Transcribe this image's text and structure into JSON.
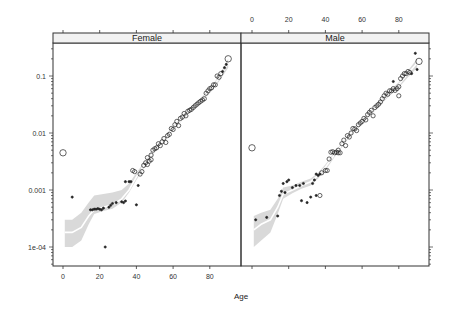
{
  "chart_data": {
    "type": "scatter",
    "title": "",
    "xlabel": "Age",
    "ylabel": "",
    "yscale": "log",
    "ylim": [
      5e-05,
      0.4
    ],
    "xlim": [
      -6,
      99
    ],
    "x_ticks": [
      0,
      20,
      40,
      60,
      80
    ],
    "y_ticks": [
      {
        "value": 0.1,
        "label": "0.1"
      },
      {
        "value": 0.01,
        "label": "0.01"
      },
      {
        "value": 0.001,
        "label": "0.001"
      },
      {
        "value": 0.0001,
        "label": "1e-04"
      }
    ],
    "grid": false,
    "smoother": "loess with grey confidence band",
    "panels": [
      {
        "strip": "Female",
        "points": [
          [
            0,
            0.0045,
            3
          ],
          [
            5,
            0.00075,
            1
          ],
          [
            15,
            0.00045,
            1
          ],
          [
            16,
            0.00045,
            1
          ],
          [
            17,
            0.00046,
            1
          ],
          [
            18,
            0.00046,
            1
          ],
          [
            19,
            0.00047,
            1
          ],
          [
            20,
            0.00046,
            1
          ],
          [
            21,
            0.00045,
            1
          ],
          [
            23,
            0.0001,
            1
          ],
          [
            22,
            0.00048,
            1
          ],
          [
            25,
            0.0005,
            1
          ],
          [
            26,
            0.00054,
            1
          ],
          [
            27,
            0.00058,
            1
          ],
          [
            29,
            0.0006,
            1
          ],
          [
            32,
            0.00062,
            1
          ],
          [
            33,
            0.0006,
            1
          ],
          [
            34,
            0.00064,
            1
          ],
          [
            34,
            0.0014,
            1
          ],
          [
            36,
            0.0014,
            1
          ],
          [
            37,
            0.0014,
            1
          ],
          [
            40,
            0.00055,
            1
          ],
          [
            41,
            0.0012,
            1
          ],
          [
            38,
            0.0022,
            2
          ],
          [
            39,
            0.0021,
            2
          ],
          [
            42,
            0.0019,
            2
          ],
          [
            43,
            0.0021,
            2
          ],
          [
            44,
            0.0027,
            2
          ],
          [
            46,
            0.0028,
            2
          ],
          [
            47,
            0.0032,
            2
          ],
          [
            45,
            0.003,
            2
          ],
          [
            46,
            0.0037,
            2
          ],
          [
            48,
            0.0034,
            2
          ],
          [
            48,
            0.0041,
            2
          ],
          [
            49,
            0.005,
            2
          ],
          [
            50,
            0.0053,
            2
          ],
          [
            51,
            0.0055,
            2
          ],
          [
            52,
            0.0065,
            2
          ],
          [
            53,
            0.006,
            2
          ],
          [
            54,
            0.007,
            2
          ],
          [
            55,
            0.008,
            2
          ],
          [
            56,
            0.0068,
            2
          ],
          [
            57,
            0.009,
            2
          ],
          [
            58,
            0.0095,
            2
          ],
          [
            59,
            0.012,
            2
          ],
          [
            60,
            0.0115,
            2
          ],
          [
            61,
            0.014,
            2
          ],
          [
            62,
            0.016,
            2
          ],
          [
            63,
            0.0135,
            2
          ],
          [
            64,
            0.018,
            2
          ],
          [
            65,
            0.019,
            2
          ],
          [
            66,
            0.022,
            2
          ],
          [
            67,
            0.02,
            2
          ],
          [
            68,
            0.024,
            2
          ],
          [
            69,
            0.025,
            2
          ],
          [
            70,
            0.026,
            2
          ],
          [
            71,
            0.028,
            2
          ],
          [
            72,
            0.03,
            2
          ],
          [
            73,
            0.032,
            2
          ],
          [
            74,
            0.034,
            2
          ],
          [
            75,
            0.036,
            2
          ],
          [
            76,
            0.038,
            2
          ],
          [
            77,
            0.04,
            2
          ],
          [
            78,
            0.05,
            2
          ],
          [
            79,
            0.055,
            2
          ],
          [
            80,
            0.06,
            2
          ],
          [
            81,
            0.062,
            2
          ],
          [
            82,
            0.07,
            2
          ],
          [
            83,
            0.07,
            2
          ],
          [
            84,
            0.1,
            2
          ],
          [
            85,
            0.095,
            2
          ],
          [
            86,
            0.11,
            2
          ],
          [
            87,
            0.12,
            1
          ],
          [
            88,
            0.14,
            1
          ],
          [
            89,
            0.16,
            1
          ],
          [
            90,
            0.2,
            3
          ]
        ],
        "smooth": [
          [
            1,
            0.00018
          ],
          [
            5,
            0.00018
          ],
          [
            10,
            0.00022
          ],
          [
            14,
            0.00035
          ],
          [
            17,
            0.00045
          ],
          [
            22,
            0.0005
          ],
          [
            27,
            0.00055
          ],
          [
            32,
            0.0007
          ],
          [
            36,
            0.001
          ],
          [
            40,
            0.0017
          ],
          [
            45,
            0.003
          ],
          [
            50,
            0.005
          ],
          [
            55,
            0.008
          ],
          [
            60,
            0.012
          ],
          [
            65,
            0.018
          ],
          [
            70,
            0.027
          ],
          [
            75,
            0.038
          ],
          [
            80,
            0.055
          ],
          [
            85,
            0.09
          ],
          [
            90,
            0.17
          ]
        ],
        "band": [
          [
            1,
            0.0001,
            0.0003
          ],
          [
            5,
            0.0001,
            0.0003
          ],
          [
            10,
            0.00013,
            0.0004
          ],
          [
            14,
            0.00025,
            0.0006
          ],
          [
            17,
            0.00038,
            0.0008
          ],
          [
            22,
            0.00043,
            0.00085
          ],
          [
            27,
            0.00047,
            0.0009
          ],
          [
            32,
            0.0006,
            0.001
          ],
          [
            36,
            0.0009,
            0.0013
          ],
          [
            40,
            0.0015,
            0.002
          ],
          [
            45,
            0.0027,
            0.0033
          ],
          [
            50,
            0.0046,
            0.0055
          ],
          [
            55,
            0.0074,
            0.0087
          ],
          [
            60,
            0.011,
            0.013
          ],
          [
            65,
            0.0168,
            0.0195
          ],
          [
            70,
            0.025,
            0.029
          ],
          [
            75,
            0.035,
            0.041
          ],
          [
            80,
            0.05,
            0.06
          ],
          [
            85,
            0.08,
            0.1
          ],
          [
            90,
            0.14,
            0.2
          ]
        ]
      },
      {
        "strip": "Male",
        "points": [
          [
            0,
            0.0055,
            3
          ],
          [
            2,
            0.0003,
            1
          ],
          [
            8,
            0.00033,
            1
          ],
          [
            14,
            0.00035,
            1
          ],
          [
            15,
            0.0008,
            1
          ],
          [
            16,
            0.00095,
            1
          ],
          [
            17,
            0.0013,
            1
          ],
          [
            19,
            0.0014,
            1
          ],
          [
            20,
            0.0015,
            1
          ],
          [
            18,
            0.0009,
            1
          ],
          [
            22,
            0.0011,
            1
          ],
          [
            24,
            0.0012,
            1
          ],
          [
            26,
            0.0012,
            1
          ],
          [
            27,
            0.00065,
            1
          ],
          [
            28,
            0.0013,
            1
          ],
          [
            30,
            0.0006,
            1
          ],
          [
            32,
            0.00075,
            1
          ],
          [
            33,
            0.0013,
            1
          ],
          [
            34,
            0.0015,
            1
          ],
          [
            35,
            0.0019,
            1
          ],
          [
            36,
            0.0018,
            1
          ],
          [
            37,
            0.0019,
            1
          ],
          [
            35,
            0.0008,
            1
          ],
          [
            37,
            0.0008,
            2
          ],
          [
            38,
            0.002,
            2
          ],
          [
            40,
            0.0022,
            2
          ],
          [
            41,
            0.0022,
            2
          ],
          [
            42,
            0.0035,
            2
          ],
          [
            43,
            0.0046,
            2
          ],
          [
            44,
            0.0047,
            2
          ],
          [
            45,
            0.0045,
            2
          ],
          [
            46,
            0.0046,
            2
          ],
          [
            47,
            0.0045,
            2
          ],
          [
            47,
            0.005,
            2
          ],
          [
            48,
            0.0045,
            2
          ],
          [
            49,
            0.0065,
            2
          ],
          [
            50,
            0.0075,
            2
          ],
          [
            51,
            0.006,
            2
          ],
          [
            52,
            0.009,
            2
          ],
          [
            53,
            0.0085,
            2
          ],
          [
            54,
            0.01,
            2
          ],
          [
            55,
            0.012,
            2
          ],
          [
            56,
            0.0118,
            2
          ],
          [
            57,
            0.011,
            2
          ],
          [
            58,
            0.014,
            2
          ],
          [
            59,
            0.015,
            2
          ],
          [
            60,
            0.016,
            2
          ],
          [
            61,
            0.018,
            2
          ],
          [
            62,
            0.017,
            2
          ],
          [
            63,
            0.021,
            2
          ],
          [
            64,
            0.023,
            2
          ],
          [
            65,
            0.025,
            2
          ],
          [
            66,
            0.02,
            2
          ],
          [
            67,
            0.028,
            2
          ],
          [
            68,
            0.03,
            2
          ],
          [
            69,
            0.032,
            2
          ],
          [
            70,
            0.035,
            2
          ],
          [
            71,
            0.04,
            2
          ],
          [
            72,
            0.045,
            2
          ],
          [
            73,
            0.05,
            2
          ],
          [
            74,
            0.048,
            2
          ],
          [
            75,
            0.055,
            2
          ],
          [
            76,
            0.055,
            2
          ],
          [
            77,
            0.06,
            2
          ],
          [
            78,
            0.056,
            2
          ],
          [
            79,
            0.06,
            2
          ],
          [
            80,
            0.065,
            2
          ],
          [
            80,
            0.045,
            2
          ],
          [
            77,
            0.08,
            1
          ],
          [
            81,
            0.09,
            2
          ],
          [
            82,
            0.1,
            2
          ],
          [
            83,
            0.11,
            2
          ],
          [
            84,
            0.11,
            2
          ],
          [
            85,
            0.12,
            2
          ],
          [
            86,
            0.115,
            2
          ],
          [
            87,
            0.11,
            1
          ],
          [
            89,
            0.25,
            1
          ],
          [
            90,
            0.13,
            1
          ],
          [
            91,
            0.18,
            3
          ]
        ],
        "smooth": [
          [
            1,
            0.0002
          ],
          [
            5,
            0.00025
          ],
          [
            10,
            0.0003
          ],
          [
            14,
            0.0005
          ],
          [
            17,
            0.00085
          ],
          [
            22,
            0.001
          ],
          [
            27,
            0.0012
          ],
          [
            32,
            0.0014
          ],
          [
            36,
            0.0018
          ],
          [
            40,
            0.0025
          ],
          [
            45,
            0.0042
          ],
          [
            50,
            0.0068
          ],
          [
            55,
            0.011
          ],
          [
            60,
            0.016
          ],
          [
            65,
            0.023
          ],
          [
            70,
            0.034
          ],
          [
            75,
            0.05
          ],
          [
            80,
            0.07
          ],
          [
            85,
            0.11
          ],
          [
            90,
            0.17
          ]
        ],
        "band": [
          [
            1,
            0.0001,
            0.00035
          ],
          [
            5,
            0.00013,
            0.0004
          ],
          [
            10,
            0.00018,
            0.00045
          ],
          [
            14,
            0.00038,
            0.0007
          ],
          [
            17,
            0.0007,
            0.0011
          ],
          [
            22,
            0.00088,
            0.0012
          ],
          [
            27,
            0.00105,
            0.0014
          ],
          [
            32,
            0.0012,
            0.0016
          ],
          [
            36,
            0.0016,
            0.002
          ],
          [
            40,
            0.0022,
            0.0028
          ],
          [
            45,
            0.0038,
            0.0046
          ],
          [
            50,
            0.0062,
            0.0074
          ],
          [
            55,
            0.01,
            0.012
          ],
          [
            60,
            0.0148,
            0.0173
          ],
          [
            65,
            0.021,
            0.025
          ],
          [
            70,
            0.031,
            0.037
          ],
          [
            75,
            0.045,
            0.055
          ],
          [
            80,
            0.063,
            0.078
          ],
          [
            85,
            0.095,
            0.125
          ],
          [
            90,
            0.14,
            0.2
          ]
        ]
      }
    ]
  },
  "colors": {
    "axis": "#333333",
    "strip_bg": "#f2f2f2",
    "band": "#d9d9d9",
    "smooth": "#ffffff",
    "points": "#222222"
  }
}
